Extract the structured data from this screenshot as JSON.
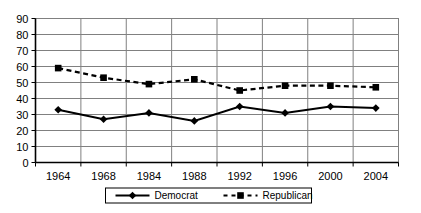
{
  "chart_data": {
    "type": "line",
    "title": "",
    "subtitle": "",
    "xlabel": "",
    "ylabel": "",
    "categories": [
      "1964",
      "1968",
      "1984",
      "1988",
      "1992",
      "1996",
      "2000",
      "2004"
    ],
    "series": [
      {
        "name": "Democrat",
        "style": "solid",
        "marker": "diamond",
        "color": "#000000",
        "values": [
          33,
          27,
          31,
          26,
          35,
          31,
          35,
          34
        ]
      },
      {
        "name": "Republican",
        "style": "dashed",
        "marker": "square",
        "color": "#000000",
        "values": [
          59,
          53,
          49,
          52,
          45,
          48,
          48,
          47
        ]
      }
    ],
    "ylim": [
      0,
      90
    ],
    "ytick_step": 10,
    "yticks": [
      "0",
      "10",
      "20",
      "30",
      "40",
      "50",
      "60",
      "70",
      "80",
      "90"
    ],
    "grid": {
      "horizontal": true,
      "vertical": true,
      "color": "#808080"
    },
    "legend": {
      "position": "bottom",
      "entries": [
        "Democrat",
        "Republican"
      ],
      "border": true
    }
  },
  "legend": {
    "democrat_label": "Democrat",
    "republican_label": "Republican"
  },
  "icons": {
    "diamond_marker": "diamond-marker-icon",
    "square_marker": "square-marker-icon"
  }
}
